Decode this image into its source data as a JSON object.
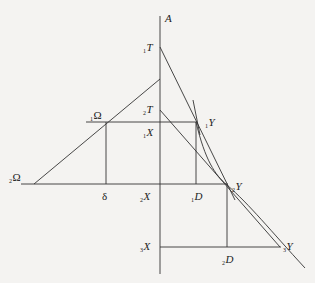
{
  "diagram": {
    "labels": {
      "A": {
        "text": "A"
      },
      "T1": {
        "sub": "1",
        "text": "T"
      },
      "T2": {
        "sub": "2",
        "text": "T"
      },
      "Omega1": {
        "sub": "1",
        "text": "Ω"
      },
      "Omega2": {
        "sub": "2",
        "text": "Ω"
      },
      "X1": {
        "sub": "1",
        "text": "X"
      },
      "X2": {
        "sub": "2",
        "text": "X"
      },
      "X3": {
        "sub": "3",
        "text": "X"
      },
      "Y1": {
        "sub": "1",
        "text": "Y"
      },
      "Y2": {
        "sub": "2",
        "text": "Y"
      },
      "Y3": {
        "sub": "3",
        "text": "Y"
      },
      "D1": {
        "sub": "1",
        "text": "D"
      },
      "D2": {
        "sub": "2",
        "text": "D"
      },
      "delta": {
        "text": "δ"
      }
    },
    "colors": {
      "line": "#333333",
      "background": "#f4f3f1"
    }
  }
}
